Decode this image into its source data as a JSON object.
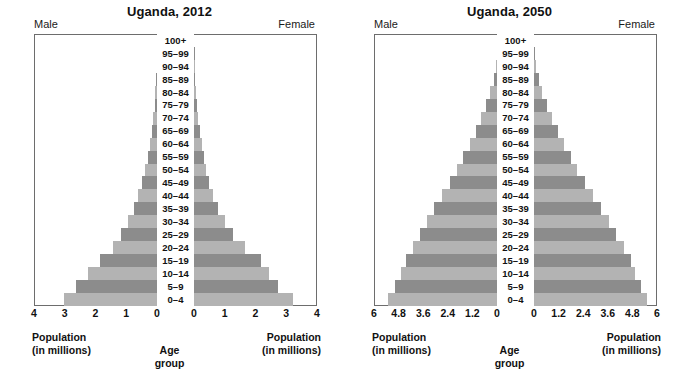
{
  "colors": {
    "bar_light": "#b3b3b3",
    "bar_dark": "#8c8c8c",
    "border": "#6d6d6d",
    "text": "#111111",
    "background": "#ffffff"
  },
  "age_groups": [
    "0–4",
    "5–9",
    "10–14",
    "15–19",
    "20–24",
    "25–29",
    "30–34",
    "35–39",
    "40–44",
    "45–49",
    "50–54",
    "55–59",
    "60–64",
    "65–69",
    "70–74",
    "75–79",
    "80–84",
    "85–89",
    "90–94",
    "95–99",
    "100+"
  ],
  "panels": [
    {
      "id": "uganda-2012",
      "title": "Uganda, 2012",
      "male_label": "Male",
      "female_label": "Female",
      "center_caption_line1": "Age",
      "center_caption_line2": "group",
      "pop_caption_line1": "Population",
      "pop_caption_line2": "(in millions)",
      "axis_max": 4,
      "ticks": [
        "4",
        "3",
        "2",
        "1",
        "0"
      ],
      "tick_values": [
        4,
        3,
        2,
        1,
        0
      ]
    },
    {
      "id": "uganda-2050",
      "title": "Uganda, 2050",
      "male_label": "Male",
      "female_label": "Female",
      "center_caption_line1": "Age",
      "center_caption_line2": "group",
      "pop_caption_line1": "Population",
      "pop_caption_line2": "(in millions)",
      "axis_max": 6,
      "ticks": [
        "6",
        "4.8",
        "3.6",
        "2.4",
        "1.2",
        "0"
      ],
      "tick_values": [
        6,
        4.8,
        3.6,
        2.4,
        1.2,
        0
      ]
    }
  ],
  "chart_data": [
    {
      "type": "bar",
      "subtype": "population-pyramid",
      "title": "Uganda, 2012",
      "xlabel": "Population (in millions)",
      "ylabel": "Age group",
      "xlim": [
        0,
        4
      ],
      "xticks": [
        4,
        3,
        2,
        1,
        0
      ],
      "grid": false,
      "legend": [
        "Male",
        "Female"
      ],
      "legend_position": "top-corners",
      "categories": [
        "0–4",
        "5–9",
        "10–14",
        "15–19",
        "20–24",
        "25–29",
        "30–34",
        "35–39",
        "40–44",
        "45–49",
        "50–54",
        "55–59",
        "60–64",
        "65–69",
        "70–74",
        "75–79",
        "80–84",
        "85–89",
        "90–94",
        "95–99",
        "100+"
      ],
      "series": [
        {
          "name": "Male",
          "side": "left",
          "values": [
            3.02,
            2.62,
            2.26,
            1.87,
            1.44,
            1.18,
            0.94,
            0.75,
            0.61,
            0.49,
            0.38,
            0.3,
            0.23,
            0.17,
            0.12,
            0.08,
            0.05,
            0.03,
            0.015,
            0.006,
            0.0
          ]
        },
        {
          "name": "Female",
          "side": "right",
          "values": [
            3.21,
            2.74,
            2.44,
            2.17,
            1.67,
            1.27,
            1.0,
            0.79,
            0.63,
            0.5,
            0.4,
            0.32,
            0.25,
            0.19,
            0.14,
            0.1,
            0.06,
            0.035,
            0.018,
            0.008,
            0.0
          ]
        }
      ]
    },
    {
      "type": "bar",
      "subtype": "population-pyramid",
      "title": "Uganda, 2050",
      "xlabel": "Population (in millions)",
      "ylabel": "Age group",
      "xlim": [
        0,
        6
      ],
      "xticks": [
        6,
        4.8,
        3.6,
        2.4,
        1.2,
        0
      ],
      "grid": false,
      "legend": [
        "Male",
        "Female"
      ],
      "legend_position": "top-corners",
      "categories": [
        "0–4",
        "5–9",
        "10–14",
        "15–19",
        "20–24",
        "25–29",
        "30–34",
        "35–39",
        "40–44",
        "45–49",
        "50–54",
        "55–59",
        "60–64",
        "65–69",
        "70–74",
        "75–79",
        "80–84",
        "85–89",
        "90–94",
        "95–99",
        "100+"
      ],
      "series": [
        {
          "name": "Male",
          "side": "left",
          "values": [
            5.3,
            5.0,
            4.7,
            4.42,
            4.1,
            3.78,
            3.4,
            3.05,
            2.66,
            2.3,
            1.95,
            1.64,
            1.32,
            1.03,
            0.76,
            0.52,
            0.32,
            0.17,
            0.07,
            0.02,
            0.0
          ]
        },
        {
          "name": "Female",
          "side": "right",
          "values": [
            5.5,
            5.2,
            4.92,
            4.72,
            4.38,
            4.02,
            3.66,
            3.27,
            2.86,
            2.5,
            2.12,
            1.8,
            1.47,
            1.16,
            0.88,
            0.62,
            0.4,
            0.22,
            0.1,
            0.03,
            0.0
          ]
        }
      ]
    }
  ]
}
